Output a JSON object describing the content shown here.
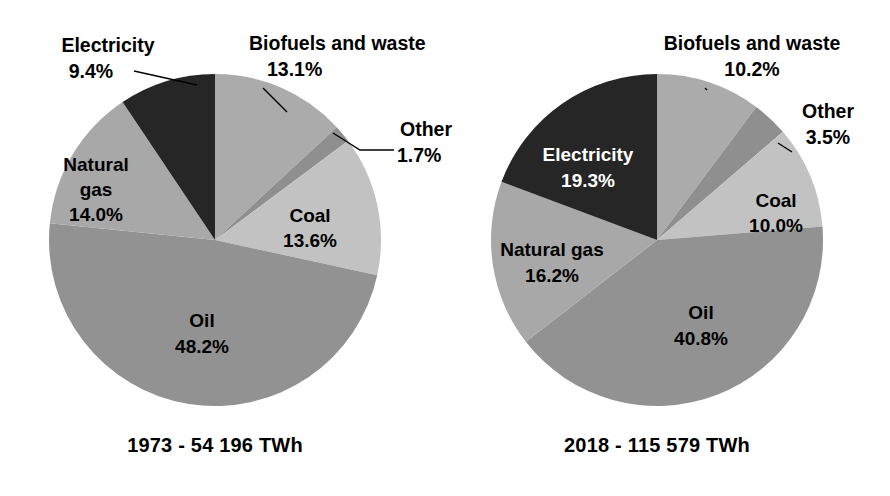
{
  "figure": {
    "background_color": "#ffffff",
    "title": ""
  },
  "palette": {
    "biofuels": "#ababab",
    "other": "#8f8f8f",
    "coal": "#c2c2c2",
    "oil": "#929292",
    "natural_gas": "#a8a8a8",
    "electricity": "#262626",
    "label_dark": "#000000",
    "label_light": "#ffffff",
    "leader_line": "#000000"
  },
  "chart_data": [
    {
      "type": "pie",
      "title": "1973 - 54 196 TWh",
      "year": "1973",
      "total": "54 196 TWh",
      "start_angle_deg": 0,
      "direction": "clockwise",
      "categories": [
        "Biofuels and waste",
        "Other",
        "Coal",
        "Oil",
        "Natural gas",
        "Electricity"
      ],
      "values": [
        13.1,
        1.7,
        13.6,
        48.2,
        14.0,
        9.4
      ],
      "value_labels": [
        "13.1%",
        "1.7%",
        "13.6%",
        "48.2%",
        "14.0%",
        "9.4%"
      ],
      "unit": "%",
      "legend": "none",
      "labels_placement": [
        "callout",
        "callout",
        "inside",
        "inside",
        "inside",
        "callout"
      ],
      "slices": [
        {
          "name": "Biofuels and waste",
          "value": 13.1,
          "value_label": "13.1%",
          "color": "#ababab",
          "label_lines": [
            "Biofuels and waste",
            "13.1%"
          ],
          "label_anchor": "start",
          "label_x": 249,
          "label_y": 50,
          "label_line2_x": 266,
          "label_line2_y": 76,
          "leader": [
            [
              263,
              88
            ],
            [
              287,
              112
            ]
          ]
        },
        {
          "name": "Other",
          "value": 1.7,
          "value_label": "1.7%",
          "color": "#8f8f8f",
          "label_lines": [
            "Other",
            "1.7%"
          ],
          "label_anchor": "start",
          "label_x": 400,
          "label_y": 136,
          "label_line2_x": 400,
          "label_line2_y": 160,
          "leader": [
            [
              394,
              150
            ],
            [
              360,
              150
            ],
            [
              333,
              133
            ]
          ]
        },
        {
          "name": "Coal",
          "value": 13.6,
          "value_label": "13.6%",
          "color": "#c2c2c2",
          "label_lines": [
            "Coal",
            "13.6%"
          ],
          "label_anchor": "middle",
          "label_x": 310,
          "label_y": 222,
          "label_line2_x": 310,
          "label_line2_y": 246,
          "leader": null
        },
        {
          "name": "Oil",
          "value": 48.2,
          "value_label": "48.2%",
          "color": "#929292",
          "label_lines": [
            "Oil",
            "48.2%"
          ],
          "label_anchor": "middle",
          "label_x": 202,
          "label_y": 326,
          "label_line2_x": 202,
          "label_line2_y": 352,
          "leader": null
        },
        {
          "name": "Natural gas",
          "value": 14.0,
          "value_label": "14.0%",
          "color": "#a8a8a8",
          "label_lines": [
            "Natural",
            "gas",
            "14.0%"
          ],
          "label_anchor": "middle",
          "label_x": 95,
          "label_y": 170,
          "label_line2_x": 95,
          "label_line2_y": 194,
          "label_line3_x": 95,
          "label_line3_y": 218,
          "leader": null
        },
        {
          "name": "Electricity",
          "value": 9.4,
          "value_label": "9.4%",
          "color": "#262626",
          "label_lines": [
            "Electricity",
            "9.4%"
          ],
          "label_anchor": "middle",
          "label_x": 108,
          "label_y": 52,
          "label_line2_x": 90,
          "label_line2_y": 78,
          "leader": [
            [
              134,
              71
            ],
            [
              197,
              85
            ]
          ]
        }
      ],
      "center": {
        "x": 215,
        "y": 240
      },
      "radius": 166
    },
    {
      "type": "pie",
      "title": "2018 - 115 579 TWh",
      "year": "2018",
      "total": "115 579 TWh",
      "start_angle_deg": 0,
      "direction": "clockwise",
      "categories": [
        "Biofuels and waste",
        "Other",
        "Coal",
        "Oil",
        "Natural gas",
        "Electricity"
      ],
      "values": [
        10.2,
        3.5,
        10.0,
        40.8,
        16.2,
        19.3
      ],
      "value_labels": [
        "10.2%",
        "3.5%",
        "10.0%",
        "40.8%",
        "16.2%",
        "19.3%"
      ],
      "unit": "%",
      "legend": "none",
      "labels_placement": [
        "callout",
        "callout",
        "inside",
        "inside",
        "inside",
        "inside"
      ],
      "slices": [
        {
          "name": "Biofuels and waste",
          "value": 10.2,
          "value_label": "10.2%",
          "color": "#ababab",
          "label_lines": [
            "Biofuels and waste",
            "10.2%"
          ],
          "label_anchor": "middle",
          "label_x": 750,
          "label_y": 50,
          "label_line2_x": 750,
          "label_line2_y": 76,
          "leader": [
            [
              705,
              88
            ],
            [
              705,
              88
            ],
            [
              707,
              90
            ]
          ]
        },
        {
          "name": "Other",
          "value": 3.5,
          "value_label": "3.5%",
          "color": "#8f8f8f",
          "label_lines": [
            "Other",
            "3.5%"
          ],
          "label_anchor": "middle",
          "label_x": 824,
          "label_y": 118,
          "label_line2_x": 824,
          "label_line2_y": 144,
          "leader": [
            [
              792,
              152
            ],
            [
              778,
              143
            ]
          ]
        },
        {
          "name": "Coal",
          "value": 10.0,
          "value_label": "10.0%",
          "color": "#c2c2c2",
          "label_lines": [
            "Coal",
            "10.0%"
          ],
          "label_anchor": "middle",
          "label_x": 775,
          "label_y": 207,
          "label_line2_x": 775,
          "label_line2_y": 231,
          "leader": null
        },
        {
          "name": "Oil",
          "value": 40.8,
          "value_label": "40.8%",
          "color": "#929292",
          "label_lines": [
            "Oil",
            "40.8%"
          ],
          "label_anchor": "middle",
          "label_x": 700,
          "label_y": 318,
          "label_line2_x": 700,
          "label_line2_y": 344,
          "leader": null
        },
        {
          "name": "Natural gas",
          "value": 16.2,
          "value_label": "16.2%",
          "color": "#a8a8a8",
          "label_lines": [
            "Natural gas",
            "16.2%"
          ],
          "label_anchor": "middle",
          "label_x": 551,
          "label_y": 255,
          "label_line2_x": 551,
          "label_line2_y": 281,
          "leader": null
        },
        {
          "name": "Electricity",
          "value": 19.3,
          "value_label": "19.3%",
          "color": "#262626",
          "label_lines": [
            "Electricity",
            "19.3%"
          ],
          "label_anchor": "middle",
          "label_x": 587,
          "label_y": 160,
          "label_line2_x": 587,
          "label_line2_y": 186,
          "leader": null
        }
      ],
      "center": {
        "x": 657,
        "y": 240
      },
      "radius": 166
    }
  ],
  "left_chart": {
    "caption": "1973 - 54 196 TWh",
    "caption_x": 215,
    "caption_y": 450,
    "biofuels_label": "Biofuels and waste",
    "biofuels_value": "13.1%",
    "other_label": "Other",
    "other_value": "1.7%",
    "coal_label": "Coal",
    "coal_value": "13.6%",
    "oil_label": "Oil",
    "oil_value": "48.2%",
    "natural_gas_label_line1": "Natural",
    "natural_gas_label_line2": "gas",
    "natural_gas_value": "14.0%",
    "electricity_label": "Electricity",
    "electricity_value": "9.4%"
  },
  "right_chart": {
    "caption": "2018 - 115 579 TWh",
    "caption_x": 657,
    "caption_y": 450,
    "biofuels_label": "Biofuels and waste",
    "biofuels_value": "10.2%",
    "other_label": "Other",
    "other_value": "3.5%",
    "coal_label": "Coal",
    "coal_value": "10.0%",
    "oil_label": "Oil",
    "oil_value": "40.8%",
    "natural_gas_label": "Natural gas",
    "natural_gas_value": "16.2%",
    "electricity_label": "Electricity",
    "electricity_value": "19.3%"
  }
}
